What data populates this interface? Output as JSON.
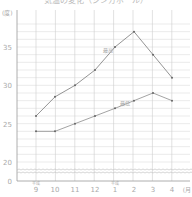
{
  "chart_data": {
    "type": "line",
    "title": "気温の変化（シンガポール）",
    "xlabel": "月",
    "ylabel": "度",
    "y_unit_label": "(度)",
    "x_unit_label": "(月)",
    "categories": [
      "9",
      "10",
      "11",
      "12",
      "1",
      "2",
      "3",
      "4"
    ],
    "category_annotations": {
      "0": "平成",
      "4": "平成"
    },
    "yticks": [
      0,
      20,
      25,
      30,
      35
    ],
    "ylim": [
      20,
      38
    ],
    "axis_break": true,
    "grid": true,
    "series": [
      {
        "name": "最高",
        "values": [
          26,
          28.5,
          30,
          32,
          35,
          37,
          34,
          31
        ],
        "color": "#888888"
      },
      {
        "name": "最低",
        "values": [
          24,
          24,
          25,
          26,
          27,
          28,
          29,
          28
        ],
        "color": "#999999"
      }
    ]
  }
}
